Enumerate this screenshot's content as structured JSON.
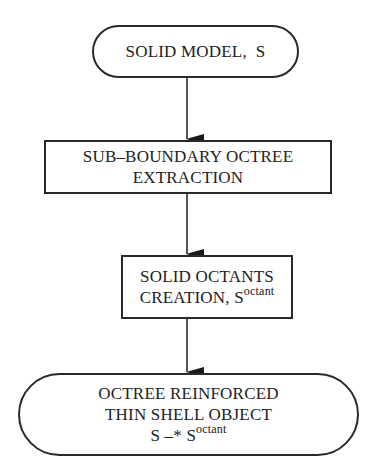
{
  "diagram": {
    "type": "flowchart",
    "direction": "top-to-bottom",
    "nodes": [
      {
        "id": "n1",
        "shape": "rounded-terminal",
        "lines": [
          "SOLID MODEL,  S"
        ]
      },
      {
        "id": "n2",
        "shape": "rectangle",
        "lines": [
          "SUB–BOUNDARY OCTREE",
          "EXTRACTION"
        ]
      },
      {
        "id": "n3",
        "shape": "rectangle",
        "lines": [
          "SOLID OCTANTS",
          "CREATION, S"
        ],
        "superscript": "octant"
      },
      {
        "id": "n4",
        "shape": "rounded-terminal",
        "lines": [
          "OCTREE REINFORCED",
          "THIN SHELL OBJECT",
          "S –* S"
        ],
        "superscript": "octant"
      }
    ],
    "edges": [
      {
        "from": "n1",
        "to": "n2"
      },
      {
        "from": "n2",
        "to": "n3"
      },
      {
        "from": "n3",
        "to": "n4"
      }
    ],
    "colors": {
      "stroke": "#2a2a2a",
      "background": "#ffffff",
      "text": "#222222"
    }
  }
}
